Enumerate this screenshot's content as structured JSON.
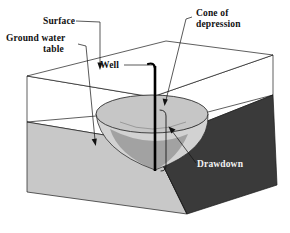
{
  "figure": {
    "background_color": "#ffffff"
  },
  "labels": {
    "surface": "Surface",
    "ground_water_table_line1": "Ground water",
    "ground_water_table_line2": "table",
    "well": "Well",
    "cone_line1": "Cone of",
    "cone_line2": "depression",
    "drawdown": "Drawdown"
  },
  "colors": {
    "outline": "#1a1a1a",
    "saturated_zone_front": "#c8c8c8",
    "saturated_zone_side": "#3a3a3a",
    "unsaturated_zone": "#ffffff",
    "cone_surface": "#c0c0c0",
    "cone_shadow": "#9a9a9a",
    "well_casing": "#000000",
    "label_text_dark": "#111111",
    "label_text_light": "#f2f2f2"
  },
  "geometry": {
    "top_face": "27,76 166,41 273,55 152,97",
    "water_table_face": "27,122 152,143 273,95 166,87",
    "block_front_left_bottom": "27,192 187,214",
    "block_right_bottom": "187,214 277,185",
    "cone_ellipse_center_x": 152,
    "cone_ellipse_center_y": 114,
    "cone_ellipse_rx": 56,
    "cone_ellipse_ry": 19,
    "cone_apex_x": 155,
    "cone_apex_y": 170,
    "well_top_y": 64,
    "well_bottom_y": 171,
    "well_x": 155
  }
}
